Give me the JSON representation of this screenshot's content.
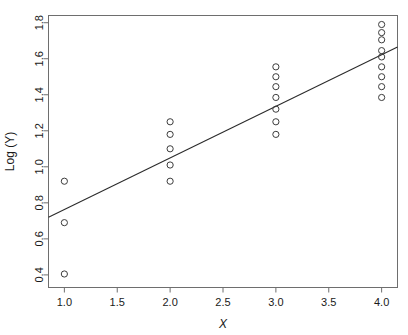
{
  "chart_data": {
    "type": "scatter",
    "title": "",
    "xlabel": "X",
    "ylabel": "Log (Y)",
    "xlim": [
      0.85,
      4.15
    ],
    "ylim": [
      0.33,
      1.84
    ],
    "grid": false,
    "legend": null,
    "xticks": [
      "1.0",
      "1.5",
      "2.0",
      "2.5",
      "3.0",
      "3.5",
      "4.0"
    ],
    "xtick_values": [
      1.0,
      1.5,
      2.0,
      2.5,
      3.0,
      3.5,
      4.0
    ],
    "yticks": [
      "0.4",
      "0.6",
      "0.8",
      "1.0",
      "1.2",
      "1.4",
      "1.6",
      "1.8"
    ],
    "ytick_values": [
      0.4,
      0.6,
      0.8,
      1.0,
      1.2,
      1.4,
      1.6,
      1.8
    ],
    "marker": "open-circle",
    "marker_color": "#3c3c3c",
    "line_color": "#2b2b2b",
    "frame_color": "#6e6e6e",
    "background": "#ffffff",
    "points": [
      {
        "x": 1,
        "y": 0.405
      },
      {
        "x": 1,
        "y": 0.69
      },
      {
        "x": 1,
        "y": 0.92
      },
      {
        "x": 2,
        "y": 0.92
      },
      {
        "x": 2,
        "y": 1.01
      },
      {
        "x": 2,
        "y": 1.1
      },
      {
        "x": 2,
        "y": 1.18
      },
      {
        "x": 2,
        "y": 1.25
      },
      {
        "x": 3,
        "y": 1.18
      },
      {
        "x": 3,
        "y": 1.25
      },
      {
        "x": 3,
        "y": 1.32
      },
      {
        "x": 3,
        "y": 1.385
      },
      {
        "x": 3,
        "y": 1.445
      },
      {
        "x": 3,
        "y": 1.5
      },
      {
        "x": 3,
        "y": 1.555
      },
      {
        "x": 4,
        "y": 1.385
      },
      {
        "x": 4,
        "y": 1.445
      },
      {
        "x": 4,
        "y": 1.5
      },
      {
        "x": 4,
        "y": 1.555
      },
      {
        "x": 4,
        "y": 1.61
      },
      {
        "x": 4,
        "y": 1.645
      },
      {
        "x": 4,
        "y": 1.705
      },
      {
        "x": 4,
        "y": 1.745
      },
      {
        "x": 4,
        "y": 1.79
      }
    ],
    "fit_line": {
      "name": "least-squares regression line",
      "x_start": 0.85,
      "y_start": 0.72,
      "x_end": 4.15,
      "y_end": 1.665,
      "slope": 0.286,
      "intercept": 0.477
    }
  }
}
